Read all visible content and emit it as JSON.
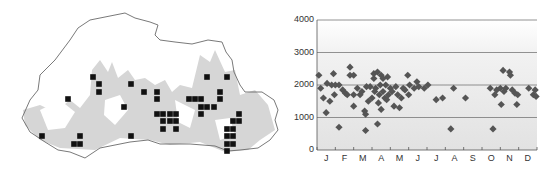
{
  "map": {
    "title": "",
    "outline_color": "#6a6a6a",
    "relief_color": "#d4d4d4",
    "marker_color": "#111111",
    "markers": [
      [
        93,
        77
      ],
      [
        99,
        84
      ],
      [
        99,
        92
      ],
      [
        68,
        99
      ],
      [
        131,
        84
      ],
      [
        144,
        92
      ],
      [
        157,
        92
      ],
      [
        157,
        99
      ],
      [
        124,
        107
      ],
      [
        42,
        136
      ],
      [
        80,
        136
      ],
      [
        74,
        144
      ],
      [
        80,
        144
      ],
      [
        131,
        136
      ],
      [
        157,
        114
      ],
      [
        163,
        114
      ],
      [
        170,
        114
      ],
      [
        176,
        114
      ],
      [
        163,
        121
      ],
      [
        170,
        121
      ],
      [
        176,
        121
      ],
      [
        163,
        129
      ],
      [
        176,
        129
      ],
      [
        189,
        99
      ],
      [
        195,
        99
      ],
      [
        201,
        99
      ],
      [
        201,
        107
      ],
      [
        207,
        107
      ],
      [
        214,
        107
      ],
      [
        201,
        114
      ],
      [
        207,
        77
      ],
      [
        227,
        77
      ],
      [
        220,
        92
      ],
      [
        220,
        99
      ],
      [
        239,
        114
      ],
      [
        233,
        121
      ],
      [
        239,
        121
      ],
      [
        227,
        129
      ],
      [
        233,
        129
      ],
      [
        227,
        136
      ],
      [
        233,
        136
      ],
      [
        227,
        144
      ],
      [
        233,
        144
      ],
      [
        227,
        151
      ]
    ]
  },
  "chart_data": {
    "type": "scatter",
    "title": "",
    "xlabel": "",
    "ylabel": "",
    "ylim": [
      0,
      4000
    ],
    "yticks": [
      0,
      1000,
      2000,
      3000,
      4000
    ],
    "gridlines": [
      1000,
      2000,
      3000,
      4000
    ],
    "categories": [
      "J",
      "F",
      "M",
      "A",
      "M",
      "J",
      "J",
      "A",
      "S",
      "O",
      "N",
      "D"
    ],
    "x_unit": "month (0-12, fractional)",
    "marker": "diamond",
    "marker_color": "#555555",
    "points": [
      [
        0.1,
        2300
      ],
      [
        0.2,
        1900
      ],
      [
        0.35,
        1600
      ],
      [
        0.5,
        1150
      ],
      [
        0.55,
        2050
      ],
      [
        0.7,
        1500
      ],
      [
        0.8,
        2000
      ],
      [
        0.9,
        2350
      ],
      [
        0.95,
        1700
      ],
      [
        1.0,
        2000
      ],
      [
        1.2,
        700
      ],
      [
        1.2,
        2000
      ],
      [
        1.4,
        1850
      ],
      [
        1.55,
        1750
      ],
      [
        1.65,
        1700
      ],
      [
        1.8,
        2550
      ],
      [
        1.8,
        2300
      ],
      [
        2.0,
        2300
      ],
      [
        2.0,
        1700
      ],
      [
        2.0,
        1350
      ],
      [
        2.2,
        1900
      ],
      [
        2.35,
        1700
      ],
      [
        2.45,
        1800
      ],
      [
        2.6,
        1200
      ],
      [
        2.65,
        1100
      ],
      [
        2.65,
        600
      ],
      [
        2.7,
        1950
      ],
      [
        2.8,
        1500
      ],
      [
        2.9,
        1950
      ],
      [
        3.0,
        1600
      ],
      [
        3.1,
        2350
      ],
      [
        3.1,
        2200
      ],
      [
        3.15,
        1800
      ],
      [
        3.2,
        1900
      ],
      [
        3.3,
        2400
      ],
      [
        3.3,
        800
      ],
      [
        3.35,
        1450
      ],
      [
        3.4,
        1700
      ],
      [
        3.45,
        2000
      ],
      [
        3.5,
        1250
      ],
      [
        3.5,
        2300
      ],
      [
        3.6,
        2200
      ],
      [
        3.6,
        1800
      ],
      [
        3.7,
        1600
      ],
      [
        3.75,
        2000
      ],
      [
        3.8,
        1550
      ],
      [
        3.85,
        2250
      ],
      [
        3.9,
        1700
      ],
      [
        4.0,
        1900
      ],
      [
        4.1,
        1800
      ],
      [
        4.2,
        1350
      ],
      [
        4.3,
        1950
      ],
      [
        4.4,
        1700
      ],
      [
        4.5,
        1300
      ],
      [
        4.6,
        1600
      ],
      [
        4.7,
        1900
      ],
      [
        4.8,
        1850
      ],
      [
        4.95,
        2300
      ],
      [
        5.0,
        1700
      ],
      [
        5.05,
        2000
      ],
      [
        5.3,
        1900
      ],
      [
        5.45,
        2100
      ],
      [
        5.55,
        1950
      ],
      [
        5.85,
        1900
      ],
      [
        6.05,
        2000
      ],
      [
        6.5,
        1550
      ],
      [
        6.85,
        1600
      ],
      [
        7.3,
        650
      ],
      [
        7.45,
        1900
      ],
      [
        8.1,
        1600
      ],
      [
        9.45,
        1900
      ],
      [
        9.6,
        650
      ],
      [
        9.7,
        1700
      ],
      [
        9.8,
        1850
      ],
      [
        10.0,
        1900
      ],
      [
        10.05,
        1400
      ],
      [
        10.15,
        2450
      ],
      [
        10.2,
        1800
      ],
      [
        10.3,
        1900
      ],
      [
        10.5,
        2400
      ],
      [
        10.55,
        2300
      ],
      [
        10.65,
        1850
      ],
      [
        10.8,
        1750
      ],
      [
        10.9,
        1400
      ],
      [
        10.95,
        1700
      ],
      [
        11.55,
        1900
      ],
      [
        11.8,
        1700
      ],
      [
        11.9,
        1850
      ],
      [
        11.95,
        1650
      ]
    ]
  }
}
